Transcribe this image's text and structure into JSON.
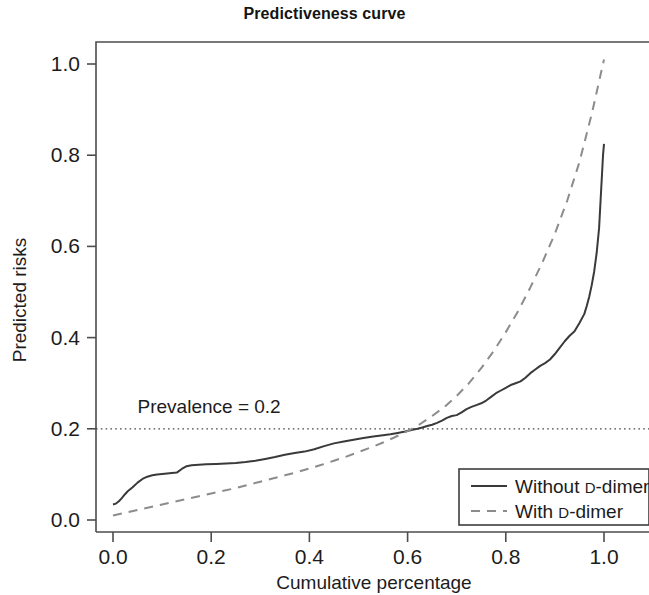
{
  "chart_data": {
    "type": "line",
    "title": "Predictiveness curve",
    "xlabel": "Cumulative percentage",
    "ylabel": "Predicted risks",
    "xlim": [
      0.0,
      1.0
    ],
    "ylim": [
      0.0,
      1.0
    ],
    "grid": false,
    "legend_position": "bottom-right",
    "xticks": [
      "0.0",
      "0.2",
      "0.4",
      "0.6",
      "0.8",
      "1.0"
    ],
    "xtick_values": [
      0.0,
      0.2,
      0.4,
      0.6,
      0.8,
      1.0
    ],
    "yticks": [
      "0.0",
      "0.2",
      "0.4",
      "0.6",
      "0.8",
      "1.0"
    ],
    "ytick_values": [
      0.0,
      0.2,
      0.4,
      0.6,
      0.8,
      1.0
    ],
    "annotations": [
      {
        "name": "prevalence-line",
        "label": "Prevalence = 0.2",
        "type": "hline",
        "y": 0.2,
        "style": "dotted",
        "color": "#4a4a4a",
        "label_x": 0.05,
        "label_y": 0.235
      }
    ],
    "series": [
      {
        "name": "Without D-dimer",
        "style": "solid",
        "color": "#3a3a3a",
        "x": [
          0.0,
          0.006,
          0.012,
          0.018,
          0.024,
          0.03,
          0.04,
          0.05,
          0.06,
          0.07,
          0.08,
          0.09,
          0.1,
          0.11,
          0.12,
          0.13,
          0.14,
          0.15,
          0.16,
          0.175,
          0.19,
          0.21,
          0.23,
          0.25,
          0.27,
          0.29,
          0.31,
          0.33,
          0.35,
          0.37,
          0.39,
          0.41,
          0.43,
          0.45,
          0.47,
          0.49,
          0.51,
          0.53,
          0.55,
          0.565,
          0.58,
          0.595,
          0.61,
          0.62,
          0.63,
          0.64,
          0.65,
          0.66,
          0.67,
          0.68,
          0.69,
          0.7,
          0.71,
          0.72,
          0.73,
          0.74,
          0.75,
          0.76,
          0.77,
          0.78,
          0.79,
          0.8,
          0.81,
          0.82,
          0.83,
          0.84,
          0.85,
          0.86,
          0.87,
          0.88,
          0.89,
          0.9,
          0.91,
          0.92,
          0.93,
          0.94,
          0.95,
          0.96,
          0.965,
          0.97,
          0.975,
          0.98,
          0.985,
          0.99,
          0.993,
          0.996,
          0.998,
          1.0
        ],
        "y": [
          0.034,
          0.036,
          0.041,
          0.048,
          0.056,
          0.063,
          0.072,
          0.082,
          0.09,
          0.095,
          0.098,
          0.1,
          0.101,
          0.102,
          0.103,
          0.104,
          0.112,
          0.118,
          0.12,
          0.121,
          0.122,
          0.123,
          0.124,
          0.125,
          0.127,
          0.13,
          0.134,
          0.138,
          0.143,
          0.147,
          0.15,
          0.155,
          0.162,
          0.168,
          0.172,
          0.176,
          0.18,
          0.183,
          0.186,
          0.188,
          0.191,
          0.194,
          0.198,
          0.2,
          0.203,
          0.206,
          0.209,
          0.213,
          0.218,
          0.224,
          0.228,
          0.23,
          0.236,
          0.243,
          0.248,
          0.252,
          0.256,
          0.262,
          0.27,
          0.278,
          0.284,
          0.29,
          0.296,
          0.3,
          0.304,
          0.312,
          0.322,
          0.33,
          0.338,
          0.344,
          0.352,
          0.364,
          0.378,
          0.392,
          0.404,
          0.414,
          0.432,
          0.452,
          0.47,
          0.49,
          0.515,
          0.545,
          0.585,
          0.64,
          0.7,
          0.76,
          0.8,
          0.825
        ]
      },
      {
        "name": "With D-dimer",
        "style": "dashed",
        "color": "#8c8c8c",
        "x": [
          0.0,
          0.025,
          0.05,
          0.075,
          0.1,
          0.125,
          0.15,
          0.175,
          0.2,
          0.225,
          0.25,
          0.275,
          0.3,
          0.325,
          0.35,
          0.375,
          0.4,
          0.425,
          0.45,
          0.475,
          0.5,
          0.525,
          0.55,
          0.575,
          0.6,
          0.625,
          0.65,
          0.675,
          0.7,
          0.725,
          0.75,
          0.775,
          0.8,
          0.825,
          0.85,
          0.875,
          0.9,
          0.925,
          0.95,
          0.975,
          1.0
        ],
        "y": [
          0.01,
          0.016,
          0.022,
          0.028,
          0.034,
          0.04,
          0.046,
          0.052,
          0.058,
          0.064,
          0.07,
          0.077,
          0.084,
          0.091,
          0.098,
          0.105,
          0.113,
          0.121,
          0.13,
          0.139,
          0.149,
          0.159,
          0.17,
          0.182,
          0.195,
          0.21,
          0.228,
          0.248,
          0.272,
          0.3,
          0.333,
          0.37,
          0.412,
          0.458,
          0.51,
          0.566,
          0.628,
          0.7,
          0.785,
          0.89,
          1.01
        ]
      }
    ]
  },
  "legend": {
    "items": [
      {
        "label_main": "Without ",
        "label_cap": "D",
        "label_rest": "-dimer",
        "style": "solid"
      },
      {
        "label_main": "With ",
        "label_cap": "D",
        "label_rest": "-dimer",
        "style": "dashed"
      }
    ]
  }
}
